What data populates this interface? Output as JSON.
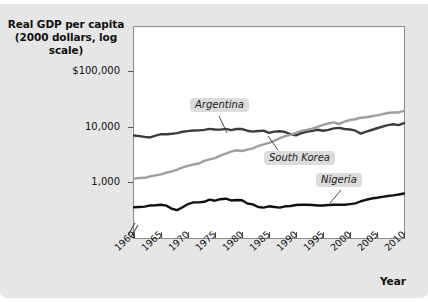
{
  "figure": {
    "title_line1": "Real GDP per capita",
    "title_line2": "(2000 dollars, log scale)",
    "background_color": "#e6e6e6",
    "plot_background_color": "#ffffff"
  },
  "chart_data": {
    "type": "line",
    "title": "Real GDP per capita (2000 dollars, log scale)",
    "xlabel": "Year",
    "ylabel": "Real GDP per capita (2000 dollars, log scale)",
    "yscale": "log",
    "ylim": [
      250,
      200000
    ],
    "xlim": [
      1960,
      2010
    ],
    "grid": false,
    "axis_break": true,
    "axis_break_note": "y-axis broken below lowest plotted values",
    "legend": "inline-annotations",
    "ytick_labels": [
      "$100,000",
      "10,000",
      "1,000"
    ],
    "ytick_values": [
      100000,
      10000,
      1000
    ],
    "xtick_labels": [
      "1960",
      "1965",
      "1970",
      "1975",
      "1980",
      "1985",
      "1990",
      "1995",
      "2000",
      "2005",
      "2010"
    ],
    "xtick_values": [
      1960,
      1965,
      1970,
      1975,
      1980,
      1985,
      1990,
      1995,
      2000,
      2005,
      2010
    ],
    "x": [
      1960,
      1961,
      1962,
      1963,
      1964,
      1965,
      1966,
      1967,
      1968,
      1969,
      1970,
      1971,
      1972,
      1973,
      1974,
      1975,
      1976,
      1977,
      1978,
      1979,
      1980,
      1981,
      1982,
      1983,
      1984,
      1985,
      1986,
      1987,
      1988,
      1989,
      1990,
      1991,
      1992,
      1993,
      1994,
      1995,
      1996,
      1997,
      1998,
      1999,
      2000,
      2001,
      2002,
      2003,
      2004,
      2005,
      2006,
      2007,
      2008,
      2009,
      2010
    ],
    "series": [
      {
        "name": "Argentina",
        "color": "#3c3c3c",
        "width": 2.4,
        "values": [
          6900,
          6700,
          6500,
          6350,
          6850,
          7300,
          7250,
          7400,
          7600,
          8050,
          8250,
          8450,
          8500,
          8700,
          9050,
          8850,
          8800,
          9050,
          8600,
          9000,
          9000,
          8400,
          8100,
          8300,
          8400,
          7700,
          8100,
          8200,
          7950,
          7250,
          6950,
          7600,
          8050,
          8350,
          8750,
          8400,
          8700,
          9250,
          9450,
          9000,
          8850,
          8400,
          7450,
          8050,
          8650,
          9300,
          9950,
          10600,
          11000,
          10600,
          11500
        ]
      },
      {
        "name": "South Korea",
        "color": "#9e9e9e",
        "width": 2.4,
        "values": [
          1150,
          1180,
          1190,
          1260,
          1320,
          1370,
          1470,
          1550,
          1670,
          1840,
          1950,
          2070,
          2150,
          2400,
          2560,
          2700,
          2990,
          3250,
          3530,
          3730,
          3620,
          3820,
          4040,
          4450,
          4780,
          5060,
          5560,
          6150,
          6720,
          7080,
          7670,
          8330,
          8690,
          9190,
          9860,
          10700,
          11350,
          11850,
          11100,
          12200,
          13100,
          13500,
          14400,
          14700,
          15300,
          15900,
          16700,
          17500,
          17900,
          17900,
          19200
        ]
      },
      {
        "name": "Nigeria",
        "color": "#111111",
        "width": 2.4,
        "values": [
          350,
          355,
          360,
          378,
          382,
          390,
          375,
          330,
          312,
          350,
          400,
          430,
          430,
          440,
          480,
          460,
          490,
          500,
          465,
          475,
          470,
          410,
          395,
          355,
          345,
          365,
          355,
          345,
          365,
          370,
          385,
          390,
          390,
          385,
          378,
          378,
          385,
          390,
          390,
          390,
          400,
          412,
          450,
          478,
          505,
          520,
          540,
          560,
          575,
          595,
          620
        ]
      }
    ],
    "annotations": [
      {
        "text": "Argentina",
        "series": "Argentina"
      },
      {
        "text": "South Korea",
        "series": "South Korea"
      },
      {
        "text": "Nigeria",
        "series": "Nigeria"
      }
    ]
  },
  "axes": {
    "x_title": "Year"
  }
}
